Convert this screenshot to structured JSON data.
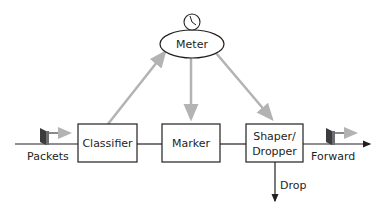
{
  "diagram": {
    "colors": {
      "line": "#231f20",
      "control_arrow": "#b3b3b3",
      "packet_face": "#6d6e71",
      "packet_side": "#3c3c3c",
      "box_fill": "#ffffff"
    },
    "nodes": {
      "meter": {
        "label": "Meter",
        "icon": "clock-icon"
      },
      "classifier": {
        "label": "Classifier"
      },
      "marker": {
        "label": "Marker"
      },
      "shaper": {
        "label_line1": "Shaper/",
        "label_line2": "Dropper"
      }
    },
    "labels": {
      "input": "Packets",
      "output": "Forward",
      "drop": "Drop"
    }
  }
}
